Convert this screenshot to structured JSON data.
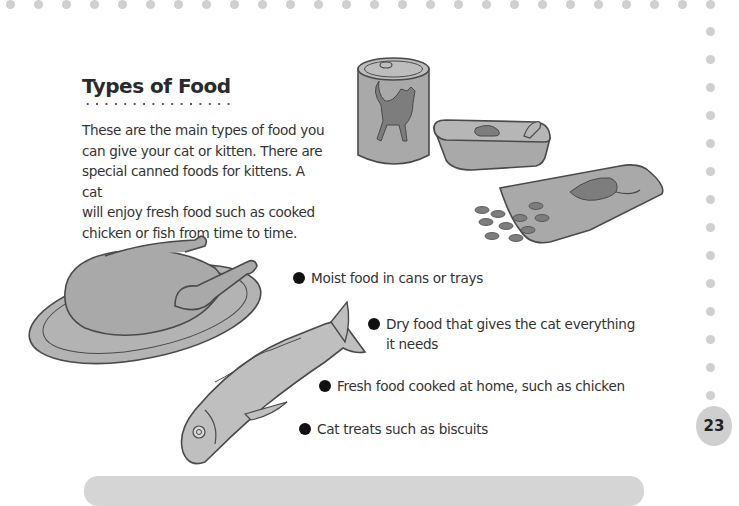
{
  "section": {
    "title": "Types of Food",
    "intro_lines": [
      "These are the main types of food you",
      "can give your cat or kitten. There are",
      "special canned foods for kittens. A cat",
      "will enjoy fresh food such as cooked",
      "chicken or fish from time to time."
    ]
  },
  "bullets": [
    {
      "lines": [
        "Moist food in cans or trays"
      ]
    },
    {
      "lines": [
        "Dry food that gives the cat everything",
        "it needs"
      ]
    },
    {
      "lines": [
        "Fresh food cooked at home, such as chicken"
      ]
    },
    {
      "lines": [
        "Cat treats such as biscuits"
      ]
    }
  ],
  "illustrations": [
    {
      "name": "cat-food-can-illustration"
    },
    {
      "name": "cat-food-tray-illustration"
    },
    {
      "name": "dry-food-bag-illustration"
    },
    {
      "name": "roast-chicken-platter-illustration"
    },
    {
      "name": "fish-illustration"
    }
  ],
  "page_number": "23",
  "colors": {
    "dots": "#cfcfcf",
    "illustration_fill": "#a9a9a9",
    "illustration_stroke": "#4a4a4a",
    "text": "#333333",
    "page_badge": "#cfcfcf"
  }
}
